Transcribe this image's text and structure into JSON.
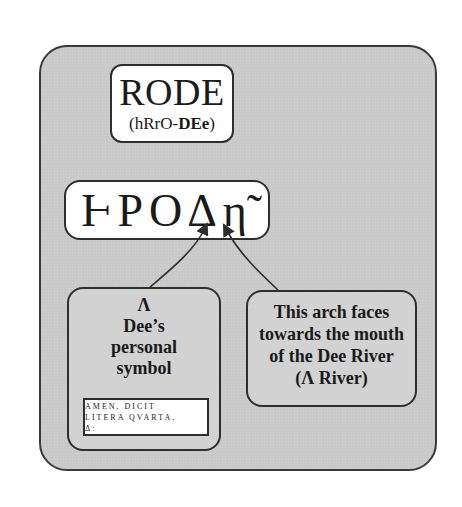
{
  "rode_box": {
    "title": "RODE",
    "pronunciation_plain": "(hRrO-",
    "pronunciation_bold": "DEe",
    "pronunciation_end": ")"
  },
  "greek_box": {
    "text": "ⱵΡΟΔη̃"
  },
  "left_box": {
    "symbol": "Λ",
    "line1": "Dee’s",
    "line2": "personal",
    "line3": "symbol",
    "quote": {
      "line1": "AMEN, DICIT",
      "line2": "LITERA QVARTA,",
      "line3": "Δ:"
    }
  },
  "right_box": {
    "line1": "This arch faces",
    "line2": "towards the mouth",
    "line3": "of the Dee River",
    "line4": "(Λ River)"
  },
  "colors": {
    "panel": "#c9c9c9",
    "border": "#2e2e2e",
    "box_white": "#ffffff",
    "box_gray": "#d2d2d2"
  }
}
